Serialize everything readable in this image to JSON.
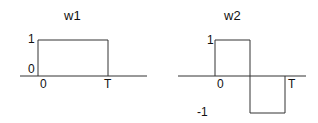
{
  "diagrams": [
    {
      "title": "w1",
      "labels": {
        "y_high": "1",
        "y_zero": "0",
        "x_zero": "0",
        "x_end": "T"
      }
    },
    {
      "title": "w2",
      "labels": {
        "y_high": "1",
        "y_low": "-1",
        "x_zero": "0",
        "x_end": "T"
      }
    }
  ],
  "colors": {
    "line": "#333333",
    "text": "#111111"
  }
}
